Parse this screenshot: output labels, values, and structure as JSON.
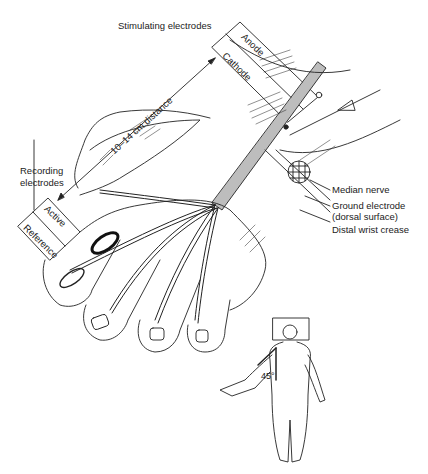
{
  "figure": {
    "labels": {
      "stimulating_electrodes": "Stimulating electrodes",
      "anode": "Anode",
      "cathode": "Cathode",
      "distance": "10–14 cm distance",
      "recording_electrodes_line1": "Recording",
      "recording_electrodes_line2": "electrodes",
      "active": "Active",
      "reference": "Reference",
      "median_nerve": "Median nerve",
      "ground_electrode_line1": "Ground electrode",
      "ground_electrode_line2": "(dorsal surface)",
      "distal_wrist_crease": "Distal wrist crease",
      "arm_angle": "45°"
    },
    "colors": {
      "line": "#222222",
      "nerve_fill": "#bdbdbd",
      "background": "#ffffff"
    }
  }
}
